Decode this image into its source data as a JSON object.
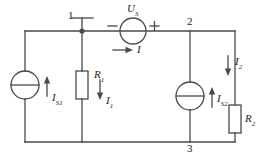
{
  "figure": {
    "type": "electrical-circuit-schematic",
    "colors": {
      "wire": "#4a4a4a",
      "text": "#1a1a1a",
      "background": "#ffffff"
    }
  },
  "nodes": {
    "node1": "1",
    "node2": "2",
    "node3": "3"
  },
  "sources": {
    "current_source_left": {
      "symbol": "I",
      "subscript": "S1"
    },
    "current_source_middle": {
      "symbol": "I",
      "subscript": "S2"
    },
    "voltage_source_top": {
      "symbol": "U",
      "subscript": "S",
      "polarity_minus": "−",
      "polarity_plus": "+"
    }
  },
  "resistors": {
    "r1": {
      "symbol": "R",
      "subscript": "1"
    },
    "r2": {
      "symbol": "R",
      "subscript": "2"
    }
  },
  "currents": {
    "branch_top": {
      "symbol": "I",
      "subscript": ""
    },
    "branch_r1": {
      "symbol": "I",
      "subscript": "1"
    },
    "branch_r2": {
      "symbol": "I",
      "subscript": "2"
    }
  }
}
